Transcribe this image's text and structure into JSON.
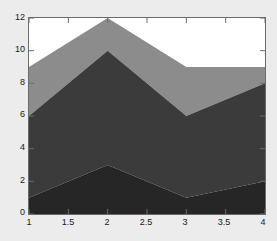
{
  "chart_data": {
    "type": "area",
    "stacked": true,
    "title": "",
    "xlabel": "",
    "ylabel": "",
    "x": [
      1,
      2,
      3,
      4
    ],
    "xlim": [
      1,
      4
    ],
    "ylim": [
      0,
      12
    ],
    "grid": false,
    "legend": "none",
    "xticks": [
      "1",
      "1.5",
      "2",
      "2.5",
      "3",
      "3.5",
      "4"
    ],
    "xtick_values": [
      1,
      1.5,
      2,
      2.5,
      3,
      3.5,
      4
    ],
    "yticks": [
      "0",
      "2",
      "4",
      "6",
      "8",
      "10",
      "12"
    ],
    "ytick_values": [
      0,
      2,
      4,
      6,
      8,
      10,
      12
    ],
    "series": [
      {
        "name": "series-1",
        "values": [
          1,
          3,
          1,
          2
        ],
        "cumulative_top": [
          1,
          3,
          1,
          2
        ],
        "color": "#262626"
      },
      {
        "name": "series-2",
        "values": [
          5,
          7,
          5,
          6
        ],
        "cumulative_top": [
          6,
          10,
          6,
          8
        ],
        "color": "#3b3b3b"
      },
      {
        "name": "series-3",
        "values": [
          3,
          2,
          3,
          1
        ],
        "cumulative_top": [
          9,
          12,
          9,
          9
        ],
        "color": "#8c8c8c"
      }
    ],
    "background_color": "#ececec",
    "plot_background_color": "#ffffff",
    "axis_color": "#6b6b6b",
    "tick_label_color": "#1a1a1a"
  }
}
